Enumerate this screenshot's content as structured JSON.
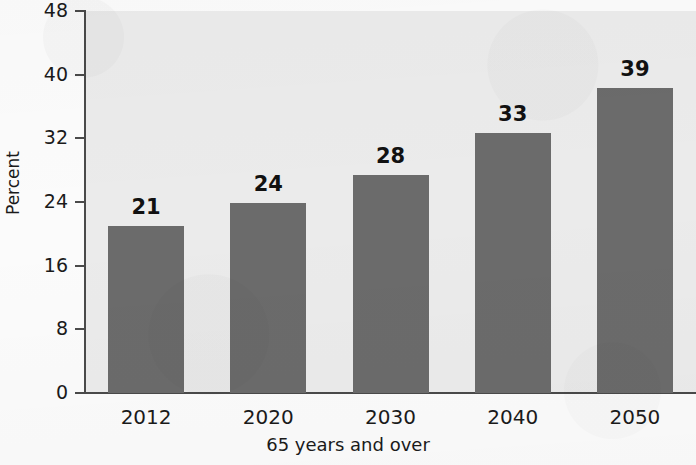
{
  "chart_data": {
    "type": "bar",
    "title": "",
    "subtitle": "",
    "xlabel": "65 years and over",
    "ylabel": "Percent",
    "categories": [
      "2012",
      "2020",
      "2030",
      "2040",
      "2050"
    ],
    "values": [
      21,
      24,
      28,
      33,
      39
    ],
    "data_labels": [
      "21",
      "24",
      "28",
      "33",
      "39"
    ],
    "series": [
      {
        "name": "Percent 65 years and over",
        "values": [
          21,
          24,
          28,
          33,
          39
        ]
      }
    ],
    "ylim": [
      0,
      48
    ],
    "yticks": [
      0,
      8,
      16,
      24,
      32,
      40,
      48
    ],
    "ytick_labels": [
      "0",
      "8",
      "16",
      "24",
      "32",
      "40",
      "48"
    ],
    "xtick_labels": [
      "2012",
      "2020",
      "2030",
      "2040",
      "2050"
    ],
    "grid": false,
    "legend": null,
    "legend_position": "none",
    "annotations": [],
    "bar_pixel_values": [
      21.0,
      23.9,
      27.4,
      32.7,
      38.3
    ],
    "colors": {
      "bar": "#6b6b6b",
      "plot_background": "#ebebeb",
      "page_background": "#fbfbfb",
      "axis": "#4a4a4a",
      "text": "#1a1a1a",
      "data_label_text": "#111111"
    }
  }
}
